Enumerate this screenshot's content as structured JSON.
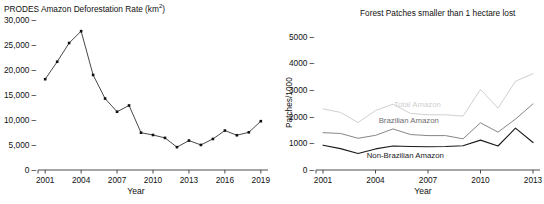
{
  "chart_data": [
    {
      "panel": "left",
      "type": "line",
      "title": "PRODES Amazon Deforestation Rate (km2)",
      "title_main": "PRODES Amazon Deforestation Rate (km",
      "title_sup": "2",
      "title_tail": ")",
      "xlabel": "Year",
      "ylabel": "",
      "xlim": [
        2000.4,
        2019.6
      ],
      "ylim": [
        0,
        30000
      ],
      "grid": false,
      "legend": "none",
      "markers": true,
      "line_color": "#333333",
      "xticks": [
        2001,
        2004,
        2007,
        2010,
        2013,
        2016,
        2019
      ],
      "xticklabels": [
        "2001",
        "2004",
        "2007",
        "2010",
        "2013",
        "2016",
        "2019"
      ],
      "yticks": [
        0,
        5000,
        10000,
        15000,
        20000,
        25000,
        30000
      ],
      "yticklabels": [
        "0",
        "5,000",
        "10,000",
        "15,000",
        "20,000",
        "25,000",
        "30,000"
      ],
      "x": [
        2001,
        2002,
        2003,
        2004,
        2005,
        2006,
        2007,
        2008,
        2009,
        2010,
        2011,
        2012,
        2013,
        2014,
        2015,
        2016,
        2017,
        2018,
        2019
      ],
      "values": [
        18165,
        21650,
        25400,
        27770,
        19010,
        14290,
        11650,
        12910,
        7460,
        7000,
        6420,
        4570,
        5890,
        5010,
        6210,
        7890,
        6950,
        7540,
        9760
      ],
      "series_name": "PRODES Amazon Deforestation Rate"
    },
    {
      "panel": "right",
      "type": "line",
      "title": "Forest Patches smaller than 1 hectare lost",
      "xlabel": "Year",
      "ylabel": "Patches/1000",
      "xlim": [
        2000.6,
        2013.4
      ],
      "ylim": [
        0,
        5400
      ],
      "grid": false,
      "legend": "inline-labels",
      "markers": false,
      "xticks": [
        2001,
        2004,
        2007,
        2010,
        2013
      ],
      "xticklabels": [
        "2001",
        "2004",
        "2007",
        "2010",
        "2013"
      ],
      "yticks": [
        0,
        1000,
        2000,
        3000,
        4000,
        5000
      ],
      "yticklabels": [
        "0",
        "1000",
        "2000",
        "3000",
        "4000",
        "5000"
      ],
      "x": [
        2001,
        2002,
        2003,
        2004,
        2005,
        2006,
        2007,
        2008,
        2009,
        2010,
        2011,
        2012,
        2013
      ],
      "series": [
        {
          "name": "Total Amazon",
          "color": "#cccccc",
          "label_x": 2006.4,
          "label_y": 2480,
          "values": [
            2290,
            2160,
            1780,
            2230,
            2470,
            2120,
            2070,
            2070,
            2020,
            3020,
            2320,
            3330,
            3610
          ]
        },
        {
          "name": "Brazilian Amazon",
          "color": "#808080",
          "label_x": 2005.9,
          "label_y": 1880,
          "values": [
            1400,
            1370,
            1190,
            1300,
            1540,
            1330,
            1290,
            1290,
            1170,
            1770,
            1420,
            1910,
            2480
          ]
        },
        {
          "name": "Non-Brazilian Amazon",
          "color": "#1a1a1a",
          "label_x": 2005.7,
          "label_y": 560,
          "values": [
            930,
            800,
            620,
            790,
            900,
            880,
            870,
            880,
            910,
            1120,
            900,
            1570,
            1030
          ]
        }
      ]
    }
  ],
  "left": {
    "title_main": "PRODES Amazon Deforestation Rate (km",
    "title_sup": "2",
    "title_tail": ")",
    "xlabel": "Year"
  },
  "right": {
    "title": "Forest Patches smaller than 1 hectare lost",
    "ylabel": "Patches/1000",
    "xlabel": "Year"
  }
}
